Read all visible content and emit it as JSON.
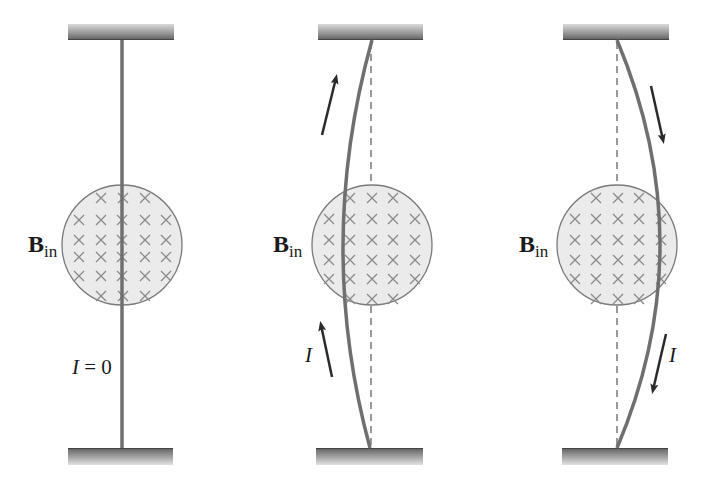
{
  "figure": {
    "colors": {
      "background": "#ffffff",
      "wire": "#6f6f6f",
      "field_fill": "#e9e9e9",
      "field_outline": "#7a7a7a",
      "cross_mark": "#8a8a8a",
      "arrow": "#2a2a2a",
      "dashed_reference": "#555555",
      "support_dark": "#5a5a5a",
      "support_light": "#d8d8d8"
    },
    "panels": [
      {
        "id": "panel-1",
        "field_label": {
          "main": "B",
          "subscript": "in"
        },
        "current_label": "I = 0",
        "wire_deflection": "none"
      },
      {
        "id": "panel-2",
        "field_label": {
          "main": "B",
          "subscript": "in"
        },
        "current_label": "I",
        "current_direction": "up",
        "wire_deflection": "left"
      },
      {
        "id": "panel-3",
        "field_label": {
          "main": "B",
          "subscript": "in"
        },
        "current_label": "I",
        "current_direction": "down",
        "wire_deflection": "right"
      }
    ],
    "field_symbol": "×"
  }
}
